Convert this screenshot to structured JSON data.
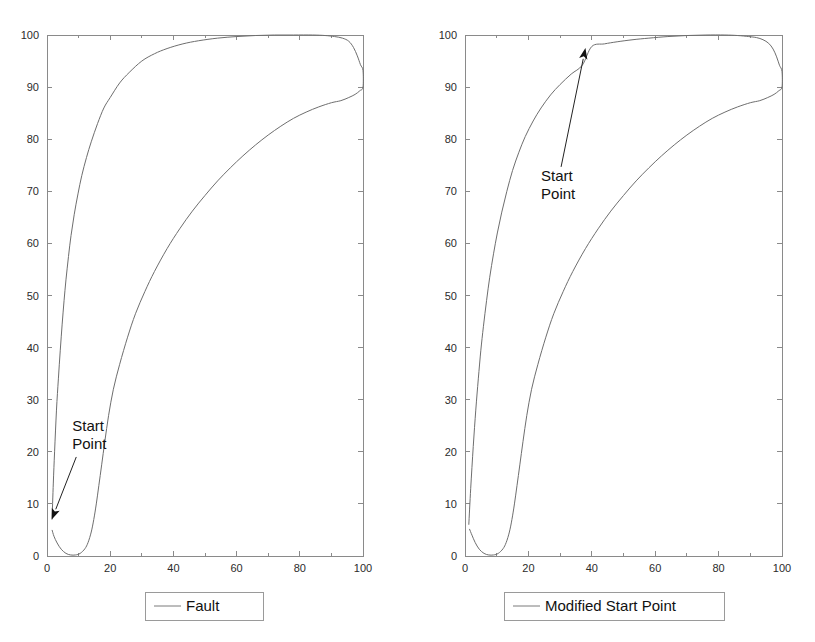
{
  "figure": {
    "title": "",
    "background_color": "#ffffff",
    "line_color": "#6e6e6e",
    "axis_color": "#8a8a8a",
    "text_color": "#111111"
  },
  "panels": [
    {
      "id": "left",
      "legend_label": "Fault",
      "annotation_label_line1": "Start",
      "annotation_label_line2": "Point",
      "x_tick_labels": [
        "0",
        "20",
        "40",
        "60",
        "80",
        "100"
      ],
      "y_tick_labels": [
        "0",
        "10",
        "20",
        "30",
        "40",
        "50",
        "60",
        "70",
        "80",
        "90",
        "100"
      ]
    },
    {
      "id": "right",
      "legend_label": "Modified Start Point",
      "annotation_label_line1": "Start",
      "annotation_label_line2": "Point",
      "x_tick_labels": [
        "0",
        "20",
        "40",
        "60",
        "80",
        "100"
      ],
      "y_tick_labels": [
        "0",
        "10",
        "20",
        "30",
        "40",
        "50",
        "60",
        "70",
        "80",
        "90",
        "100"
      ]
    }
  ],
  "chart_data": [
    {
      "type": "line",
      "title": "Fault",
      "xlabel": "",
      "ylabel": "",
      "xlim": [
        0,
        100
      ],
      "ylim": [
        0,
        100
      ],
      "x_ticks": [
        0,
        20,
        40,
        60,
        80,
        100
      ],
      "y_ticks": [
        0,
        10,
        20,
        30,
        40,
        50,
        60,
        70,
        80,
        90,
        100
      ],
      "x_minor_ticks": [
        10,
        30,
        50,
        70,
        90
      ],
      "grid": false,
      "legend_position": "below-axes-center",
      "annotations": [
        {
          "text": "Start Point",
          "text_x": 8,
          "text_y": 24,
          "arrow_tip_x": 1.5,
          "arrow_tip_y": 7,
          "arrow_direction": "down-left"
        }
      ],
      "series": [
        {
          "name": "Fault",
          "closed_loop": true,
          "comment": "single closed trajectory; listed as upper (rising) branch then lower (returning) branch",
          "upper_branch": {
            "x": [
              1.6,
              2.0,
              2.4,
              3.0,
              3.6,
              4.2,
              4.8,
              5.4,
              6.0,
              6.8,
              7.6,
              8.6,
              9.8,
              11.0,
              12.5,
              14.0,
              16.0,
              18.0,
              20.0,
              23.0,
              26.0,
              30.0,
              34.0,
              38.0,
              43.0,
              48.0,
              54.0,
              60.0,
              66.0,
              72.0,
              78.0,
              84.0,
              88.0,
              91.0,
              93.5,
              95.5,
              97.0,
              98.2,
              99.2,
              100.0
            ],
            "y": [
              7.0,
              14.0,
              20.0,
              28.0,
              34.0,
              39.5,
              44.5,
              49.0,
              53.0,
              57.5,
              61.5,
              65.5,
              69.5,
              73.0,
              76.5,
              79.5,
              83.0,
              86.0,
              88.0,
              90.8,
              92.8,
              95.0,
              96.4,
              97.4,
              98.3,
              98.9,
              99.4,
              99.7,
              99.9,
              100.0,
              100.0,
              100.0,
              99.9,
              99.7,
              99.4,
              98.8,
              97.6,
              96.0,
              94.3,
              93.2
            ]
          },
          "lower_branch": {
            "x": [
              100.0,
              99.0,
              97.5,
              95.5,
              93.0,
              90.0,
              86.0,
              82.0,
              78.0,
              74.0,
              70.0,
              66.0,
              62.0,
              58.0,
              54.0,
              50.0,
              46.0,
              42.0,
              38.0,
              34.0,
              31.0,
              28.0,
              25.5,
              23.0,
              21.0,
              19.5,
              18.3,
              17.3,
              16.4,
              15.6,
              14.8,
              14.0,
              13.0,
              12.0,
              10.5,
              9.0,
              7.5,
              6.0,
              4.5,
              3.2,
              2.2,
              1.6
            ],
            "y": [
              90.0,
              89.3,
              88.6,
              88.0,
              87.4,
              87.0,
              86.2,
              85.2,
              84.0,
              82.5,
              80.8,
              78.9,
              76.8,
              74.5,
              72.0,
              69.2,
              66.2,
              62.8,
              59.0,
              54.6,
              50.8,
              46.5,
              42.0,
              36.8,
              32.0,
              27.0,
              22.0,
              17.5,
              13.5,
              10.0,
              7.0,
              4.6,
              2.6,
              1.4,
              0.5,
              0.2,
              0.2,
              0.5,
              1.3,
              2.5,
              3.8,
              5.0
            ]
          }
        }
      ]
    },
    {
      "type": "line",
      "title": "Modified Start Point",
      "xlabel": "",
      "ylabel": "",
      "xlim": [
        0,
        100
      ],
      "ylim": [
        0,
        100
      ],
      "x_ticks": [
        0,
        20,
        40,
        60,
        80,
        100
      ],
      "y_ticks": [
        0,
        10,
        20,
        30,
        40,
        50,
        60,
        70,
        80,
        90,
        100
      ],
      "x_minor_ticks": [
        10,
        30,
        50,
        70,
        90
      ],
      "grid": false,
      "legend_position": "below-axes-center",
      "annotations": [
        {
          "text": "Start Point",
          "text_x": 24,
          "text_y": 72,
          "arrow_tip_x": 38,
          "arrow_tip_y": 97.5,
          "arrow_direction": "up-right"
        }
      ],
      "series": [
        {
          "name": "Modified Start Point",
          "closed_loop": true,
          "comment": "single closed trajectory starting at the annotated Start Point on the upper branch",
          "upper_branch": {
            "x": [
              1.2,
              1.8,
              2.6,
              3.4,
              4.2,
              5.0,
              5.8,
              6.8,
              7.8,
              9.0,
              10.2,
              11.6,
              13.2,
              15.0,
              17.0,
              19.0,
              21.5,
              24.0,
              27.0,
              30.0,
              33.5,
              37.0,
              40.0,
              44.0,
              48.0,
              53.0,
              58.0,
              64.0,
              70.0,
              76.0,
              82.0,
              86.0,
              89.5,
              92.0,
              94.0,
              95.8,
              97.2,
              98.3,
              99.2,
              100.0
            ],
            "y": [
              6.0,
              13.0,
              21.0,
              28.0,
              34.0,
              39.5,
              44.0,
              49.0,
              53.5,
              58.0,
              62.0,
              66.0,
              70.0,
              74.0,
              77.5,
              80.5,
              83.5,
              86.0,
              88.5,
              90.5,
              92.5,
              94.2,
              97.8,
              98.3,
              98.7,
              99.1,
              99.4,
              99.7,
              99.9,
              100.0,
              100.0,
              99.9,
              99.7,
              99.5,
              99.1,
              98.4,
              97.3,
              95.8,
              94.2,
              93.0
            ]
          },
          "lower_branch": {
            "x": [
              100.0,
              99.0,
              97.5,
              95.5,
              93.0,
              90.0,
              86.0,
              82.0,
              78.0,
              74.0,
              70.0,
              66.0,
              62.0,
              58.0,
              54.0,
              50.0,
              46.0,
              42.0,
              38.0,
              34.0,
              31.0,
              28.0,
              25.5,
              23.0,
              21.0,
              19.5,
              18.3,
              17.3,
              16.4,
              15.6,
              14.8,
              14.0,
              13.0,
              12.0,
              10.5,
              9.0,
              7.5,
              6.0,
              4.5,
              3.2,
              2.2,
              1.4
            ],
            "y": [
              90.0,
              89.3,
              88.6,
              88.0,
              87.4,
              87.0,
              86.2,
              85.2,
              84.0,
              82.5,
              80.8,
              78.9,
              76.8,
              74.5,
              72.0,
              69.2,
              66.2,
              62.8,
              59.0,
              54.6,
              50.8,
              46.5,
              42.0,
              36.8,
              32.0,
              27.0,
              22.0,
              17.5,
              13.5,
              10.0,
              7.0,
              4.6,
              2.6,
              1.4,
              0.5,
              0.2,
              0.2,
              0.5,
              1.3,
              2.6,
              4.0,
              5.2
            ]
          }
        }
      ]
    }
  ]
}
